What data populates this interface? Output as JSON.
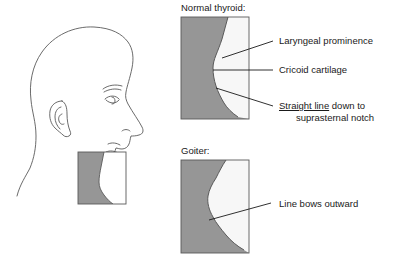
{
  "figure": {
    "title_normal": "Normal thyroid:",
    "title_goiter": "Goiter:",
    "annotations": {
      "laryngeal": "Laryngeal prominence",
      "cricoid": "Cricoid cartilage",
      "straight_line_emph": "Straight line",
      "straight_line_rest": " down to",
      "straight_line_second": "suprasternal notch",
      "bows": "Line bows outward"
    },
    "colors": {
      "fill_gray": "#969696",
      "outline": "#5a5a5a",
      "leader": "#1a1a1a",
      "text": "#1a1a1a",
      "background": "#ffffff"
    },
    "panels": [
      {
        "name": "normal-thyroid-panel",
        "label": "Normal thyroid:",
        "box": {
          "x": 181,
          "y": 17,
          "w": 68,
          "h": 102
        },
        "callouts": [
          "Laryngeal prominence",
          "Cricoid cartilage",
          "Straight line down to suprasternal notch"
        ]
      },
      {
        "name": "goiter-panel",
        "label": "Goiter:",
        "box": {
          "x": 181,
          "y": 160,
          "w": 68,
          "h": 93
        },
        "callouts": [
          "Line bows outward"
        ]
      }
    ],
    "head": {
      "name": "head-profile",
      "inset_box": {
        "x": 78,
        "y": 152,
        "w": 48,
        "h": 52
      }
    }
  }
}
